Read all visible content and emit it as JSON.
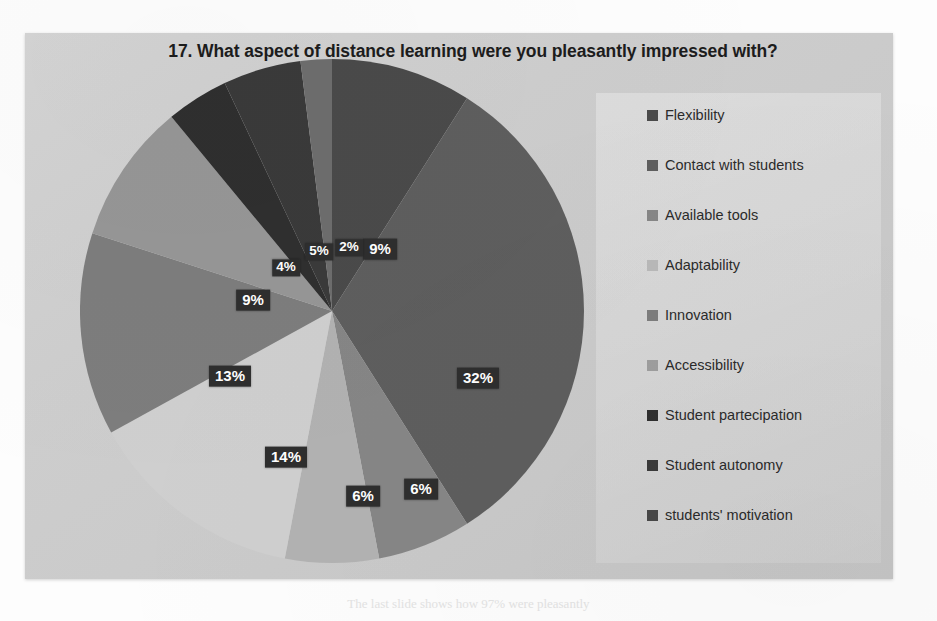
{
  "chart_data": {
    "type": "pie",
    "title": "17. What aspect of distance learning were you pleasantly impressed with?",
    "categories": [
      "Flexibility",
      "Contact with students",
      "Available tools",
      "Adaptability",
      "Innovation",
      "Accessibility",
      "Student partecipation",
      "Student autonomy",
      "students' motivation"
    ],
    "values": [
      32,
      6,
      6,
      14,
      13,
      9,
      4,
      5,
      2
    ],
    "slice_labels": [
      "32%",
      "6%",
      "6%",
      "14%",
      "13%",
      "9%",
      "4%",
      "5%",
      "2%"
    ],
    "extra_slice": {
      "label": "9%",
      "value": 9
    },
    "all_slice_labels_clockwise_from_top": [
      "9%",
      "32%",
      "6%",
      "6%",
      "14%",
      "13%",
      "9%",
      "4%",
      "5%",
      "2%"
    ],
    "all_slice_values_clockwise_from_top": [
      9,
      32,
      6,
      6,
      14,
      13,
      9,
      4,
      5,
      2
    ],
    "colors": [
      "#4a4a4a",
      "#5e5e5e",
      "#868686",
      "#b2b2b2",
      "#cfcfcf",
      "#7d7d7d",
      "#969696",
      "#2f2f2f",
      "#3a3a3a",
      "#6d6d6d",
      "#9e9e9e"
    ],
    "legend_position": "right",
    "grid": false,
    "units": "percent",
    "label_style": "dark-box-white-text"
  },
  "legend": {
    "items": [
      {
        "label": "Flexibility",
        "color": "#4a4a4a"
      },
      {
        "label": "Contact with students",
        "color": "#5e5e5e"
      },
      {
        "label": "Available tools",
        "color": "#868686"
      },
      {
        "label": "Adaptability",
        "color": "#b8b8b8"
      },
      {
        "label": "Innovation",
        "color": "#7d7d7d"
      },
      {
        "label": "Accessibility",
        "color": "#9e9e9e"
      },
      {
        "label": "Student partecipation",
        "color": "#2f2f2f"
      },
      {
        "label": "Student autonomy",
        "color": "#3a3a3a"
      },
      {
        "label": "students' motivation",
        "color": "#484848"
      }
    ]
  },
  "pie_labels": [
    {
      "text": "9%",
      "x": 355,
      "y": 216,
      "size": "normal"
    },
    {
      "text": "32%",
      "x": 453,
      "y": 345,
      "size": "normal"
    },
    {
      "text": "6%",
      "x": 396,
      "y": 456,
      "size": "normal"
    },
    {
      "text": "6%",
      "x": 338,
      "y": 463,
      "size": "normal"
    },
    {
      "text": "14%",
      "x": 261,
      "y": 424,
      "size": "normal"
    },
    {
      "text": "13%",
      "x": 205,
      "y": 343,
      "size": "normal"
    },
    {
      "text": "9%",
      "x": 228,
      "y": 267,
      "size": "normal"
    },
    {
      "text": "4%",
      "x": 261,
      "y": 235,
      "size": "small"
    },
    {
      "text": "5%",
      "x": 294,
      "y": 219,
      "size": "small"
    },
    {
      "text": "2%",
      "x": 324,
      "y": 215,
      "size": "small"
    }
  ],
  "page": {
    "bleed_text": "The last slide shows how 97% were pleasantly"
  }
}
